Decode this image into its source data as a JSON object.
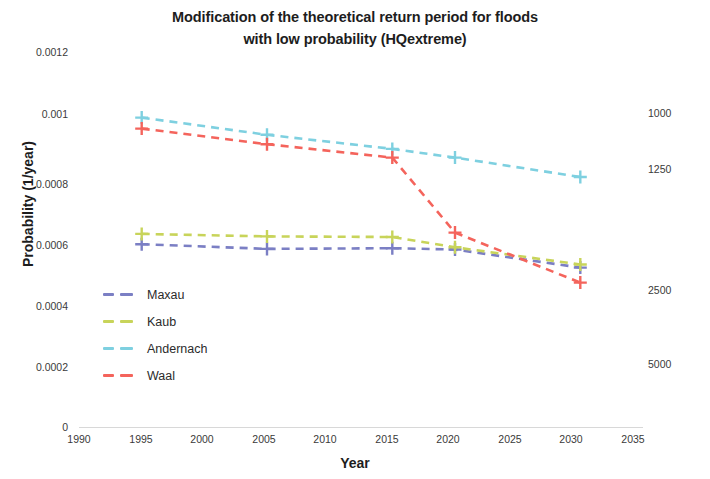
{
  "chart_data": {
    "type": "line",
    "title": "Modification of the theoretical return period for floods with low probability (HQextreme)",
    "title_line1": "Modification of the theoretical return period for floods",
    "title_line2": "with low probability (HQextreme)",
    "xlabel": "Year",
    "ylabel": "Probability (1/year)",
    "ylabel_right": "Return period (year)",
    "grid": false,
    "legend_position": "inner-left",
    "x": [
      1995,
      2005,
      2015,
      2020,
      2030
    ],
    "xlim": [
      1990,
      2035
    ],
    "xticks": [
      "1990",
      "1995",
      "2000",
      "2005",
      "2010",
      "2015",
      "2020",
      "2025",
      "2030",
      "2035"
    ],
    "xtick_values": [
      1990,
      1995,
      2000,
      2005,
      2010,
      2015,
      2020,
      2025,
      2030,
      2035
    ],
    "ylim": [
      0,
      0.0012
    ],
    "yticks": [
      "0",
      "0.0002",
      "0.0004",
      "0.0006",
      "0.0008",
      "0.001",
      "0.0012"
    ],
    "ytick_values": [
      0,
      0.0002,
      0.0004,
      0.0006,
      0.0008,
      0.001,
      0.0012
    ],
    "yticks_right": [
      "1000",
      "1250",
      "2500",
      "5000"
    ],
    "ytick_right_values": [
      0.001,
      0.0008,
      0.0004,
      0.0002
    ],
    "series": [
      {
        "name": "Maxau",
        "color": "#7b7fc4",
        "values": [
          0.000585,
          0.00057,
          0.000572,
          0.000568,
          0.00051
        ]
      },
      {
        "name": "Kaub",
        "color": "#c8d45a",
        "values": [
          0.000618,
          0.00061,
          0.000608,
          0.000575,
          0.00052
        ]
      },
      {
        "name": "Andernach",
        "color": "#7ed0e0",
        "values": [
          0.00099,
          0.000935,
          0.00089,
          0.000862,
          0.0008
        ]
      },
      {
        "name": "Waal",
        "color": "#f4645c",
        "values": [
          0.000955,
          0.000905,
          0.000862,
          0.000622,
          0.000462
        ]
      }
    ]
  },
  "legend": {
    "items": [
      {
        "label": "Maxau",
        "color": "#7b7fc4"
      },
      {
        "label": "Kaub",
        "color": "#c8d45a"
      },
      {
        "label": "Andernach",
        "color": "#7ed0e0"
      },
      {
        "label": "Waal",
        "color": "#f4645c"
      }
    ]
  },
  "colors": {
    "maxau": "#7b7fc4",
    "kaub": "#c8d45a",
    "andernach": "#7ed0e0",
    "waal": "#f4645c",
    "text": "#1d1d1d",
    "background": "#ffffff"
  }
}
